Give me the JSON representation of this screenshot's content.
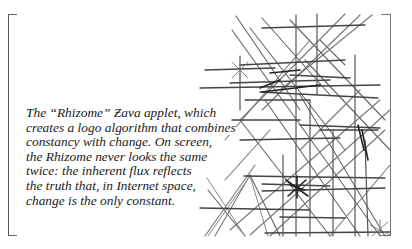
{
  "caption": {
    "lines": [
      "The “Rhizome” Ƶava applet, which",
      "creates a logo algorithm that combines",
      "constancy with change. On screen,",
      "the Rhizome never looks the same",
      "twice: the inherent flux reflects",
      "the truth that, in Internet space,",
      "change is the only constant."
    ]
  },
  "figure": {
    "name": "Rhizome logo line drawing",
    "stroke_colors": [
      "#333333",
      "#555555",
      "#777777",
      "#999999"
    ]
  }
}
